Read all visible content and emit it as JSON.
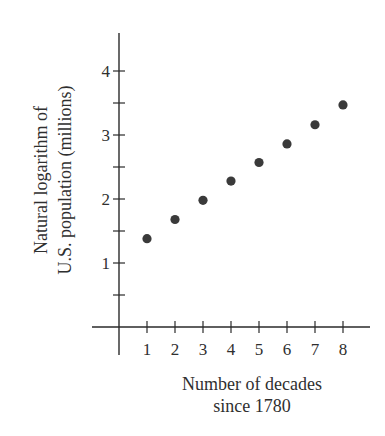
{
  "chart_data": {
    "type": "scatter",
    "title": "",
    "xlabel": "Number of decades since 1780",
    "xlabel_lines": [
      "Number of decades",
      "since 1780"
    ],
    "ylabel": "Natural logarithm of U.S. population (millions)",
    "ylabel_lines": [
      "Natural logarithm of",
      "U.S. population (millions)"
    ],
    "x": [
      1,
      2,
      3,
      4,
      5,
      6,
      7,
      8
    ],
    "y": [
      1.38,
      1.68,
      1.98,
      2.28,
      2.57,
      2.86,
      3.16,
      3.47
    ],
    "x_ticks": [
      1,
      2,
      3,
      4,
      5,
      6,
      7,
      8
    ],
    "y_ticks_labeled": [
      1,
      2,
      3,
      4
    ],
    "y_ticks_minor": [
      0.5,
      1.5,
      2.5,
      3.5
    ],
    "xlim": [
      0,
      8.9
    ],
    "ylim": [
      -0.4,
      4.6
    ],
    "grid": false,
    "legend": null,
    "marker_color": "#3a3a3a",
    "axis_color": "#2a2a2a"
  }
}
